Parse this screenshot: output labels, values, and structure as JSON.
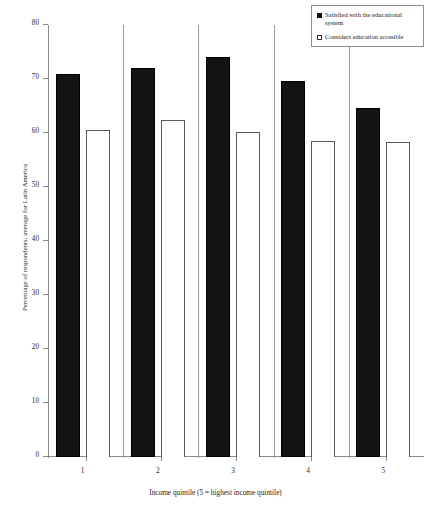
{
  "chart_data": {
    "type": "bar",
    "title": "",
    "subtitle": "",
    "xlabel": "Income quintile (5 = highest income quintile)",
    "ylabel": "Percentage of respondents, average for Latin America",
    "categories": [
      "1",
      "2",
      "3",
      "4",
      "5"
    ],
    "ylim": [
      0,
      80
    ],
    "yticks": [
      0,
      10,
      20,
      30,
      40,
      50,
      60,
      70,
      80
    ],
    "ytick_labels": [
      "0",
      "10",
      "20",
      "30",
      "40",
      "50",
      "60",
      "70",
      "80"
    ],
    "grid": false,
    "legend_position": "top-right",
    "series": [
      {
        "name": "Satisfied with the educational system",
        "color": "#131313",
        "style": "filled",
        "values": [
          71.0,
          72.1,
          74.0,
          69.6,
          64.7
        ]
      },
      {
        "name": "Considers education accesible",
        "color": "#ffffff",
        "style": "outlined",
        "values": [
          60.6,
          62.4,
          60.1,
          58.6,
          58.3
        ]
      }
    ]
  },
  "legend": {
    "items": [
      {
        "label": "Satisfied with the educational system",
        "marker": "filled-square-icon"
      },
      {
        "label": "Considers education accesible",
        "marker": "open-square-icon"
      }
    ]
  }
}
